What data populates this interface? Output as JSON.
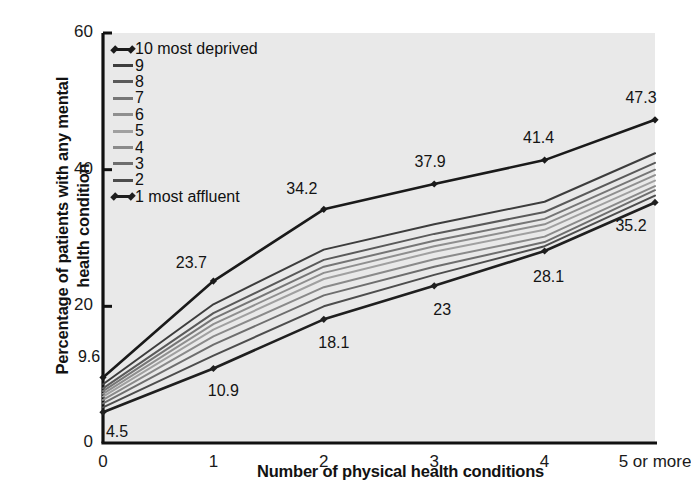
{
  "chart_data": {
    "type": "line",
    "title": "",
    "xlabel": "Number of physical health conditions",
    "ylabel": "Percentage of patients with any mental health condition",
    "categories": [
      "0",
      "1",
      "2",
      "3",
      "4",
      "5 or more"
    ],
    "xlim": [
      0,
      5
    ],
    "ylim": [
      0,
      60
    ],
    "yticks": [
      "0",
      "20",
      "40",
      "60"
    ],
    "ytick_values": [
      0,
      20,
      40,
      60
    ],
    "grid": false,
    "legend_position": "top-left",
    "plot_background": "#e9e9e9",
    "series": [
      {
        "name": "10 most deprived",
        "legend_label": "10 most deprived",
        "color": "#1a1a1a",
        "markers": true,
        "values": [
          9.6,
          23.7,
          34.2,
          37.9,
          41.4,
          47.3
        ],
        "data_labels": [
          "9.6",
          "23.7",
          "34.2",
          "37.9",
          "41.4",
          "47.3"
        ]
      },
      {
        "name": "9",
        "legend_label": "9",
        "color": "#3d3d3d",
        "markers": false,
        "values": [
          8.6,
          20.3,
          28.3,
          32.0,
          35.3,
          42.4
        ],
        "data_labels": []
      },
      {
        "name": "8",
        "legend_label": "8",
        "color": "#5a5a5a",
        "markers": false,
        "values": [
          8.0,
          19.0,
          26.8,
          30.6,
          33.8,
          41.0
        ],
        "data_labels": []
      },
      {
        "name": "7",
        "legend_label": "7",
        "color": "#767676",
        "markers": false,
        "values": [
          7.6,
          18.2,
          25.8,
          29.6,
          32.8,
          40.0
        ],
        "data_labels": []
      },
      {
        "name": "6",
        "legend_label": "6",
        "color": "#8f8f8f",
        "markers": false,
        "values": [
          7.2,
          17.4,
          24.9,
          28.8,
          32.0,
          39.2
        ],
        "data_labels": []
      },
      {
        "name": "5",
        "legend_label": "5",
        "color": "#a0a0a0",
        "markers": false,
        "values": [
          6.8,
          16.6,
          24.0,
          28.0,
          31.2,
          38.4
        ],
        "data_labels": []
      },
      {
        "name": "4",
        "legend_label": "4",
        "color": "#8a8a8a",
        "markers": false,
        "values": [
          6.3,
          15.6,
          22.8,
          26.9,
          30.2,
          37.6
        ],
        "data_labels": []
      },
      {
        "name": "3",
        "legend_label": "3",
        "color": "#6e6e6e",
        "markers": false,
        "values": [
          5.8,
          14.4,
          21.6,
          25.8,
          29.4,
          37.0
        ],
        "data_labels": []
      },
      {
        "name": "2",
        "legend_label": "2",
        "color": "#4d4d4d",
        "markers": false,
        "values": [
          5.2,
          12.8,
          20.0,
          24.6,
          28.8,
          36.2
        ],
        "data_labels": []
      },
      {
        "name": "1 most affluent",
        "legend_label": "1 most affluent",
        "color": "#1f1f1f",
        "markers": true,
        "values": [
          4.5,
          10.9,
          18.1,
          23,
          28.1,
          35.2
        ],
        "data_labels": [
          "4.5",
          "10.9",
          "18.1",
          "23",
          "28.1",
          "35.2"
        ]
      }
    ],
    "annotations": [
      {
        "text": "9.6",
        "series": "10 most deprived",
        "x": 0,
        "y": 9.6
      },
      {
        "text": "23.7",
        "series": "10 most deprived",
        "x": 1,
        "y": 23.7
      },
      {
        "text": "34.2",
        "series": "10 most deprived",
        "x": 2,
        "y": 34.2
      },
      {
        "text": "37.9",
        "series": "10 most deprived",
        "x": 3,
        "y": 37.9
      },
      {
        "text": "41.4",
        "series": "10 most deprived",
        "x": 4,
        "y": 41.4
      },
      {
        "text": "47.3",
        "series": "10 most deprived",
        "x": 5,
        "y": 47.3
      },
      {
        "text": "4.5",
        "series": "1 most affluent",
        "x": 0,
        "y": 4.5
      },
      {
        "text": "10.9",
        "series": "1 most affluent",
        "x": 1,
        "y": 10.9
      },
      {
        "text": "18.1",
        "series": "1 most affluent",
        "x": 2,
        "y": 18.1
      },
      {
        "text": "23",
        "series": "1 most affluent",
        "x": 3,
        "y": 23
      },
      {
        "text": "28.1",
        "series": "1 most affluent",
        "x": 4,
        "y": 28.1
      },
      {
        "text": "35.2",
        "series": "1 most affluent",
        "x": 5,
        "y": 35.2
      }
    ]
  },
  "axis": {
    "color": "#111111"
  }
}
